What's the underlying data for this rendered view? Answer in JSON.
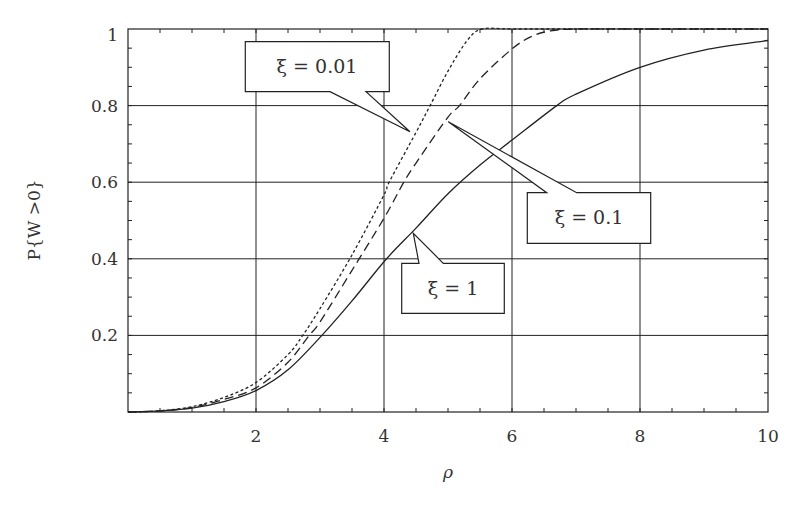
{
  "chart_data": {
    "type": "line",
    "title": "",
    "xlabel": "ρ",
    "ylabel": "P{W >0}",
    "xlim": [
      0,
      10
    ],
    "ylim": [
      0,
      1
    ],
    "grid": true,
    "legend": "callouts",
    "x_ticks": [
      2,
      4,
      6,
      8,
      10
    ],
    "x_tick_labels": [
      "2",
      "4",
      "6",
      "8",
      "10"
    ],
    "y_ticks": [
      0.2,
      0.4,
      0.6,
      0.8,
      1
    ],
    "y_tick_labels": [
      "0.2",
      "0.4",
      "0.6",
      "0.8",
      "1"
    ],
    "series": [
      {
        "name": "ξ = 0.01",
        "style": "dotted",
        "x": [
          0,
          0.5,
          1,
          1.5,
          2,
          2.5,
          2.73,
          3,
          3.5,
          4,
          4.08,
          4.5,
          4.72,
          5,
          5.3,
          5.53,
          6,
          7,
          8,
          10
        ],
        "y": [
          0,
          0.003,
          0.014,
          0.038,
          0.077,
          0.15,
          0.2,
          0.27,
          0.41,
          0.567,
          0.6,
          0.73,
          0.8,
          0.89,
          0.97,
          1.0,
          1.0,
          1.0,
          1.0,
          1.0
        ]
      },
      {
        "name": "ξ = 0.1",
        "style": "dashed",
        "x": [
          0,
          0.5,
          1,
          1.5,
          2,
          2.5,
          2.83,
          3,
          3.5,
          4,
          4.31,
          4.5,
          5,
          5.18,
          5.5,
          6,
          6.3,
          6.6,
          7,
          8,
          10
        ],
        "y": [
          0,
          0.003,
          0.012,
          0.033,
          0.063,
          0.13,
          0.2,
          0.235,
          0.37,
          0.506,
          0.6,
          0.65,
          0.77,
          0.8,
          0.87,
          0.948,
          0.98,
          0.995,
          1.0,
          1.0,
          1.0
        ]
      },
      {
        "name": "ξ = 1",
        "style": "solid",
        "x": [
          0,
          0.5,
          1,
          1.5,
          2,
          2.5,
          3.03,
          3.5,
          4.04,
          4.5,
          5,
          5.5,
          6,
          6.7,
          7,
          8,
          9,
          10
        ],
        "y": [
          0,
          0.003,
          0.01,
          0.027,
          0.056,
          0.11,
          0.2,
          0.29,
          0.4,
          0.48,
          0.57,
          0.645,
          0.71,
          0.8,
          0.83,
          0.9,
          0.945,
          0.97
        ]
      }
    ],
    "annotations": [
      {
        "text": "ξ = 0.01",
        "target_series": "ξ = 0.01",
        "pointer_at": [
          4.45,
          0.75
        ]
      },
      {
        "text": "ξ = 0.1",
        "target_series": "ξ = 0.1",
        "pointer_at": [
          5.0,
          0.76
        ]
      },
      {
        "text": "ξ = 1",
        "target_series": "ξ = 1",
        "pointer_at": [
          4.46,
          0.465
        ]
      }
    ]
  },
  "labels": {
    "xlabel": "ρ",
    "ylabel": "P{W >0}",
    "callout_001": "ξ = 0.01",
    "callout_01": "ξ = 0.1",
    "callout_1": "ξ = 1",
    "xticks": [
      "2",
      "4",
      "6",
      "8",
      "10"
    ],
    "yticks": [
      "0.2",
      "0.4",
      "0.6",
      "0.8",
      "1"
    ]
  }
}
